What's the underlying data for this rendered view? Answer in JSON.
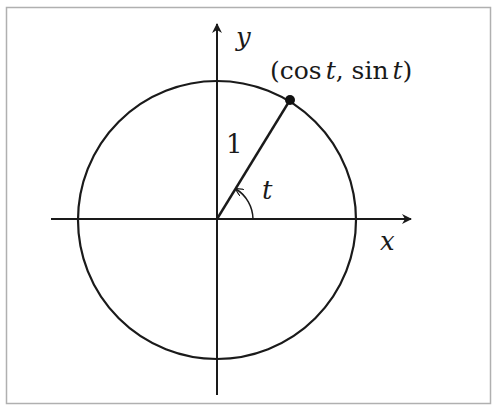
{
  "diagram": {
    "labels": {
      "y_axis": "y",
      "x_axis": "x",
      "point": "(cos t, sin t)",
      "point_open": "(",
      "point_cos": "cos",
      "point_t1": "t",
      "point_comma": ", ",
      "point_sin": "sin",
      "point_t2": "t",
      "point_close": ")",
      "radius": "1",
      "angle": "t"
    },
    "geometry": {
      "center": [
        217,
        220
      ],
      "radius_px": 139,
      "point_px": [
        290,
        100
      ]
    },
    "colors": {
      "stroke": "#1a1a1a",
      "frame": "#b0b0b0",
      "background": "#ffffff"
    }
  }
}
